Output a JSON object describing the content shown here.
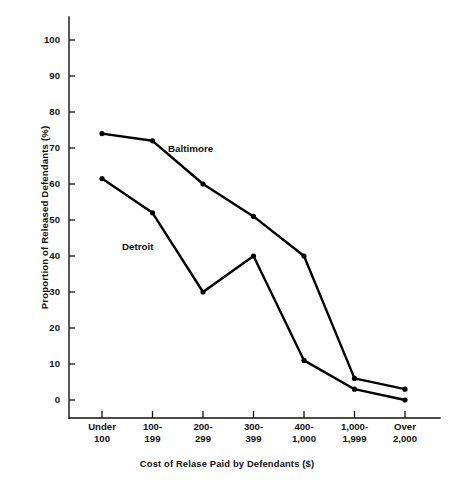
{
  "chart_data": {
    "type": "line",
    "title": "",
    "xlabel": "Cost of Relase Paid by Defendants ($)",
    "ylabel": "Proportion of Released Defendants (%)",
    "categories": [
      "Under\n100",
      "100-\n199",
      "200-\n299",
      "300-\n399",
      "400-\n1,000",
      "1,000-\n1,999",
      "Over\n2,000"
    ],
    "category_lines": [
      [
        "Under",
        "100"
      ],
      [
        "100-",
        "199"
      ],
      [
        "200-",
        "299"
      ],
      [
        "300-",
        "399"
      ],
      [
        "400-",
        "1,000"
      ],
      [
        "1,000-",
        "1,999"
      ],
      [
        "Over",
        "2,000"
      ]
    ],
    "series": [
      {
        "name": "Baltimore",
        "values": [
          74,
          72,
          60,
          51,
          40,
          6,
          3
        ],
        "color": "#000000",
        "label_position": {
          "x": 168,
          "y": 152
        }
      },
      {
        "name": "Detroit",
        "values": [
          61.5,
          52,
          30,
          40,
          11,
          3,
          0
        ],
        "color": "#000000",
        "label_position": {
          "x": 122,
          "y": 250
        }
      }
    ],
    "ylim": [
      0,
      100
    ],
    "yticks": [
      0,
      10,
      20,
      30,
      40,
      50,
      60,
      70,
      80,
      90,
      100
    ],
    "ytick_labels": [
      "0",
      "10",
      "20",
      "30",
      "40",
      "50",
      "60",
      "70",
      "80",
      "90",
      "100"
    ],
    "grid": false,
    "legend": "inline-annotations",
    "marker": "filled-circle"
  }
}
